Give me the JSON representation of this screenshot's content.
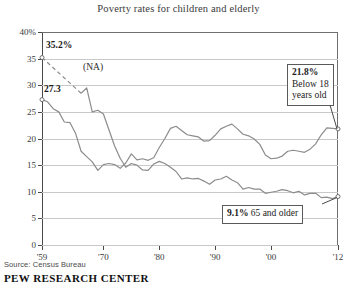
{
  "chart_data": {
    "type": "line",
    "title": "Poverty rates for children and elderly",
    "xlabel": "",
    "ylabel": "",
    "xlim": [
      1959,
      2012
    ],
    "ylim": [
      0,
      40
    ],
    "y_ticks": [
      "40%",
      "35",
      "30",
      "25",
      "20",
      "15",
      "10",
      "5",
      "0"
    ],
    "y_tick_values": [
      40,
      35,
      30,
      25,
      20,
      15,
      10,
      5,
      0
    ],
    "x_ticks": [
      "'59",
      "'70",
      "'80",
      "'90",
      "'00",
      "'12"
    ],
    "x_tick_values": [
      1959,
      1970,
      1980,
      1990,
      2000,
      2012
    ],
    "grid": "horizontal",
    "legend_position": "annotations",
    "annotations": [
      {
        "text": "35.2%",
        "kind": "start-value",
        "series": "65 and older",
        "x": 1959,
        "y": 35.2
      },
      {
        "text": "(NA)",
        "kind": "gap-note",
        "series": "65 and older",
        "x": 1963,
        "y": 31.5
      },
      {
        "text": "27.3",
        "kind": "start-value",
        "series": "Below 18 years old",
        "x": 1959,
        "y": 27.3
      },
      {
        "text": "21.8%",
        "kind": "callout-value",
        "series": "Below 18 years old",
        "x": 2012,
        "y": 21.8
      },
      {
        "text": "Below 18",
        "kind": "callout-line",
        "series": "Below 18 years old"
      },
      {
        "text": "years old",
        "kind": "callout-line",
        "series": "Below 18 years old"
      },
      {
        "text": "9.1%",
        "kind": "callout-value",
        "series": "65 and older",
        "x": 2012,
        "y": 9.1
      },
      {
        "text": "65 and older",
        "kind": "callout-line",
        "series": "65 and older"
      }
    ],
    "series": [
      {
        "name": "Below 18 years old",
        "color": "#8c8c8c",
        "start_value": 27.3,
        "end_value": 21.8,
        "x": [
          1959,
          1960,
          1961,
          1962,
          1963,
          1964,
          1965,
          1966,
          1967,
          1968,
          1969,
          1970,
          1971,
          1972,
          1973,
          1974,
          1975,
          1976,
          1977,
          1978,
          1979,
          1980,
          1981,
          1982,
          1983,
          1984,
          1985,
          1986,
          1987,
          1988,
          1989,
          1990,
          1991,
          1992,
          1993,
          1994,
          1995,
          1996,
          1997,
          1998,
          1999,
          2000,
          2001,
          2002,
          2003,
          2004,
          2005,
          2006,
          2007,
          2008,
          2009,
          2010,
          2011,
          2012
        ],
        "values": [
          27.3,
          26.9,
          25.6,
          25.0,
          23.1,
          23.0,
          21.0,
          17.6,
          16.6,
          15.6,
          14.0,
          15.1,
          15.3,
          15.1,
          14.4,
          15.4,
          17.1,
          16.0,
          16.2,
          15.9,
          16.4,
          18.3,
          20.0,
          21.9,
          22.3,
          21.5,
          20.7,
          20.5,
          20.3,
          19.5,
          19.6,
          20.6,
          21.8,
          22.3,
          22.7,
          21.8,
          20.8,
          20.5,
          19.9,
          18.9,
          16.9,
          16.2,
          16.3,
          16.7,
          17.6,
          17.8,
          17.6,
          17.4,
          18.0,
          19.0,
          20.7,
          22.0,
          21.9,
          21.8
        ]
      },
      {
        "name": "65 and older",
        "color": "#8c8c8c",
        "start_value": 35.2,
        "end_value": 9.1,
        "gap_note": "(NA)",
        "gap_years": [
          1959,
          1966
        ],
        "x": [
          1959,
          1966,
          1967,
          1968,
          1969,
          1970,
          1971,
          1972,
          1973,
          1974,
          1975,
          1976,
          1977,
          1978,
          1979,
          1980,
          1981,
          1982,
          1983,
          1984,
          1985,
          1986,
          1987,
          1988,
          1989,
          1990,
          1991,
          1992,
          1993,
          1994,
          1995,
          1996,
          1997,
          1998,
          1999,
          2000,
          2001,
          2002,
          2003,
          2004,
          2005,
          2006,
          2007,
          2008,
          2009,
          2010,
          2011,
          2012
        ],
        "values": [
          35.2,
          28.5,
          29.5,
          25.0,
          25.3,
          24.6,
          21.6,
          18.6,
          16.3,
          14.6,
          15.3,
          15.0,
          14.1,
          14.0,
          15.2,
          15.7,
          15.3,
          14.6,
          13.8,
          12.4,
          12.6,
          12.4,
          12.5,
          12.0,
          11.4,
          12.2,
          12.4,
          12.9,
          12.2,
          11.7,
          10.5,
          10.8,
          10.5,
          10.5,
          9.7,
          9.9,
          10.1,
          10.4,
          10.2,
          9.8,
          10.1,
          9.4,
          9.7,
          9.7,
          8.9,
          9.0,
          8.7,
          9.1
        ]
      }
    ]
  },
  "footer": {
    "source": "Source: Census Bureau",
    "brand": "PEW RESEARCH CENTER"
  },
  "callouts": {
    "children": {
      "value": "21.8%",
      "line1": "Below 18",
      "line2": "years old"
    },
    "elderly": {
      "value": "9.1%",
      "label": "65 and older"
    }
  },
  "inline_labels": {
    "elderly_start": "35.2%",
    "na": "(NA)",
    "children_start": "27.3"
  }
}
